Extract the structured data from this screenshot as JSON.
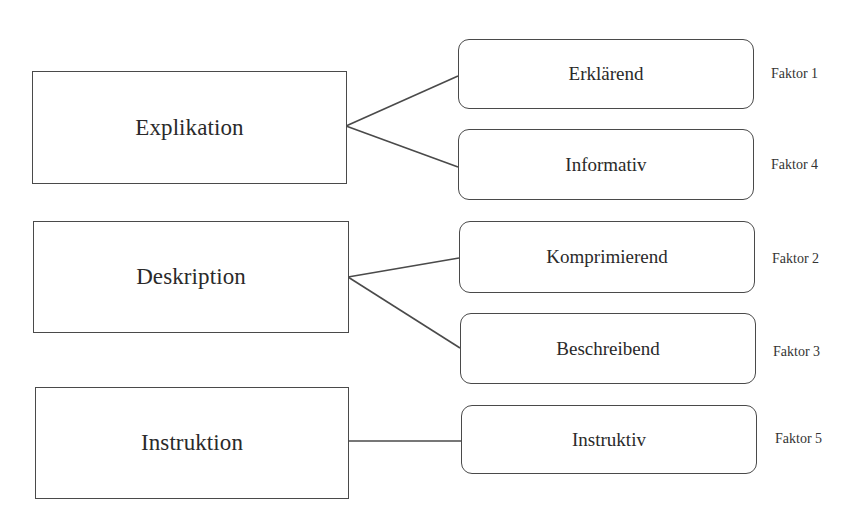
{
  "diagram": {
    "type": "tree-mapping",
    "categories": [
      {
        "label": "Explikation",
        "children": [
          {
            "label": "Erklärend",
            "factor": "Faktor 1"
          },
          {
            "label": "Informativ",
            "factor": "Faktor 4"
          }
        ]
      },
      {
        "label": "Deskription",
        "children": [
          {
            "label": "Komprimierend",
            "factor": "Faktor 2"
          },
          {
            "label": "Beschreibend",
            "factor": "Faktor 3"
          }
        ]
      },
      {
        "label": "Instruktion",
        "children": [
          {
            "label": "Instruktiv",
            "factor": "Faktor 5"
          }
        ]
      }
    ],
    "colors": {
      "line": "#4a4a4a",
      "text": "#2a2a2a",
      "background": "#ffffff"
    }
  }
}
